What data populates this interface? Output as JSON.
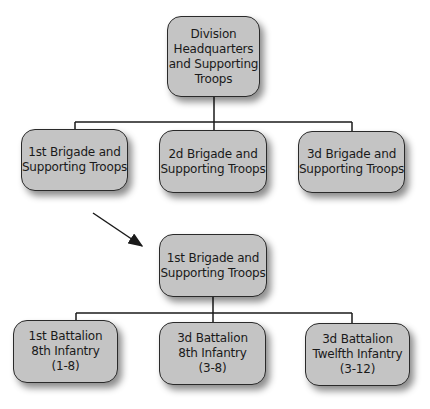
{
  "diagram": {
    "type": "organization-chart",
    "colors": {
      "box_fill": "#c4c4c4",
      "box_border": "#2a2a2a",
      "line": "#1a1a1a",
      "text": "#1a1a1a"
    },
    "top": {
      "lines": [
        "Division",
        "Headquarters",
        "and Supporting",
        "Troops"
      ]
    },
    "brigades": [
      {
        "lines": [
          "1st Brigade and",
          "Supporting Troops"
        ]
      },
      {
        "lines": [
          "2d Brigade and",
          "Supporting Troops"
        ]
      },
      {
        "lines": [
          "3d Brigade and",
          "Supporting Troops"
        ]
      }
    ],
    "expanded": {
      "lines": [
        "1st Brigade and",
        "Supporting Troops"
      ]
    },
    "battalions": [
      {
        "lines": [
          "1st Battalion",
          "8th Infantry",
          "(1-8)"
        ]
      },
      {
        "lines": [
          "3d Battalion",
          "8th Infantry",
          "(3-8)"
        ]
      },
      {
        "lines": [
          "3d Battalion",
          "Twelfth Infantry",
          "(3-12)"
        ]
      }
    ],
    "arrow": {
      "from": "1st Brigade and Supporting Troops",
      "to": "expanded 1st Brigade",
      "icon": "arrow-down-right-icon"
    }
  }
}
